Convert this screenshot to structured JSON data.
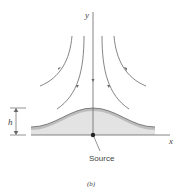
{
  "diagram": {
    "axis_labels": {
      "x": "x",
      "y": "y"
    },
    "height_label": "h",
    "source_label": "Source",
    "caption": "(b)",
    "colors": {
      "line": "#555555",
      "hump_fill": "#dcdcdc",
      "hump_band": "#bdbdbd",
      "axis": "#666666"
    }
  }
}
